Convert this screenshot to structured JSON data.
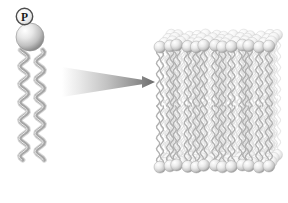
{
  "figure": {
    "background_color": "#ffffff",
    "width": 288,
    "height": 203
  },
  "phospholipid": {
    "name": "phospholipid-molecule",
    "phosphate_label": "P",
    "phosphate_circle": {
      "cx": 24.5,
      "cy": 16.5,
      "r": 8.2,
      "fill": "#f2f2f2",
      "stroke": "#4d4d4d"
    },
    "head_sphere": {
      "cx": 30,
      "cy": 37,
      "r": 14,
      "light": "#f0f0f0",
      "mid": "#bdbdbd",
      "dark": "#8c8c8c"
    },
    "tails": [
      {
        "name": "fatty-acid-tail-1",
        "x": 24,
        "y_top": 50,
        "y_bottom": 160,
        "amplitude": 4.2,
        "wavelength": 18
      },
      {
        "name": "fatty-acid-tail-2",
        "x": 40,
        "y_top": 50,
        "y_bottom": 160,
        "amplitude": 4.2,
        "wavelength": 18
      }
    ],
    "tail_color_light": "#d9d9d9",
    "tail_color_mid": "#a6a6a6",
    "tail_color_dark": "#7a7a7a"
  },
  "arrow": {
    "name": "magnification-arrow",
    "direction": "right",
    "tail_x": 62,
    "tip_x": 155,
    "center_y": 82,
    "tail_half_height": 15,
    "tip_half_height": 2.2,
    "head_half_height": 6,
    "head_length": 13,
    "fill_start": "#ffffff",
    "fill_end": "#6e6e6e"
  },
  "membrane": {
    "name": "lipid-bilayer-membrane",
    "left": 157,
    "right": 281,
    "top": 8,
    "bottom": 196,
    "front_face_left": 160,
    "front_face_right": 268,
    "depth_dx": 14,
    "depth_dy": -14,
    "outer_leaflet_head_y": 46,
    "inner_leaflet_head_y": 166,
    "midline_y": 106,
    "columns": 13,
    "depth_rows": 4,
    "head_radius": 6.0,
    "head_light": "#fbfbfb",
    "head_mid": "#d4d4d4",
    "head_dark": "#9c9c9c",
    "tail_color": "#b0b0b0",
    "tail_color_back": "#dcdcdc",
    "tails_per_column": 2
  },
  "palette": {
    "background": "#ffffff",
    "outline_gray": "#4d4d4d",
    "sphere_highlight": "#fdfdfd",
    "sphere_shadow": "#8a8a8a",
    "arrow_dark": "#6e6e6e"
  }
}
